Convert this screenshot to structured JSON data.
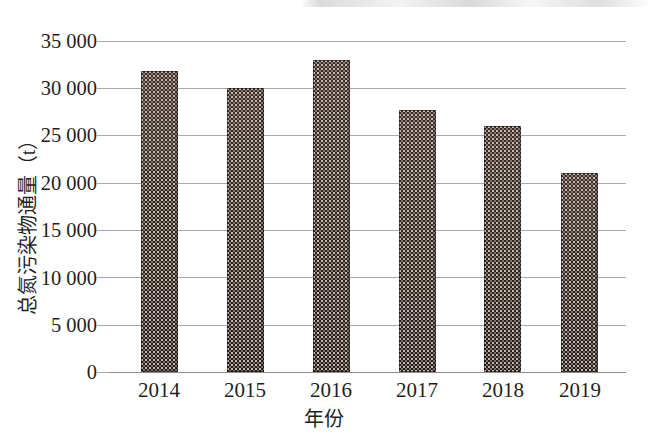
{
  "chart_data": {
    "type": "bar",
    "title": "",
    "subtitle": "",
    "categories": [
      "2014",
      "2015",
      "2016",
      "2017",
      "2018",
      "2019"
    ],
    "values": [
      31800,
      30000,
      33000,
      27700,
      26000,
      21000
    ],
    "series": [
      {
        "name": "总氮污染物通量",
        "values": [
          31800,
          30000,
          33000,
          27700,
          26000,
          21000
        ]
      }
    ],
    "xlabel": "年份",
    "ylabel": "总氮污染物通量（t）",
    "ylim": [
      0,
      35000
    ],
    "ytick_values": [
      0,
      5000,
      10000,
      15000,
      20000,
      25000,
      30000,
      35000
    ],
    "ytick_labels": [
      "0",
      "5 000",
      "10 000",
      "15 000",
      "20 000",
      "25 000",
      "30 000",
      "35 000"
    ],
    "xtick_labels": [
      "2014",
      "2015",
      "2016",
      "2017",
      "2018",
      "2019"
    ],
    "grid": true,
    "grid_axis": "y",
    "legend": false,
    "legend_position": "none",
    "bar_color": "#2f2320",
    "bar_pattern": "fine-dotted-texture",
    "gridline_color": "#a9a9a9",
    "axis_color": "#8d8d8d",
    "text_color": "#1f1f1f",
    "background": "#ffffff"
  },
  "axis": {
    "y_title": "总氮污染物通量（t）",
    "x_title": "年份"
  }
}
